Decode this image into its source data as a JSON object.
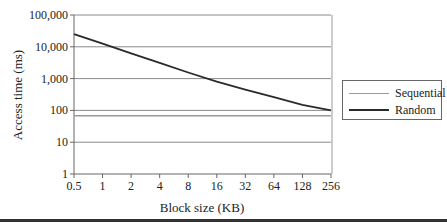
{
  "chart_data": {
    "type": "line",
    "title": "",
    "xlabel": "Block size (KB)",
    "ylabel": "Access time (ms)",
    "x": [
      "0.5",
      "1",
      "2",
      "4",
      "8",
      "16",
      "32",
      "64",
      "128",
      "256"
    ],
    "y_scale": "log",
    "ylim": [
      1,
      100000
    ],
    "y_ticks": [
      "1",
      "10",
      "100",
      "1,000",
      "10,000",
      "100,000"
    ],
    "grid": true,
    "legend_position": "right",
    "series": [
      {
        "name": "Sequential",
        "color": "#9a9a9a",
        "values": [
          68,
          68,
          68,
          68,
          68,
          68,
          68,
          68,
          68,
          68
        ]
      },
      {
        "name": "Random",
        "color": "#2a2a2a",
        "values": [
          25000,
          12500,
          6250,
          3125,
          1560,
          800,
          450,
          260,
          150,
          100
        ]
      }
    ]
  },
  "legend": {
    "items": [
      {
        "label": "Sequential",
        "color": "#9a9a9a"
      },
      {
        "label": "Random",
        "color": "#2a2a2a"
      }
    ]
  }
}
